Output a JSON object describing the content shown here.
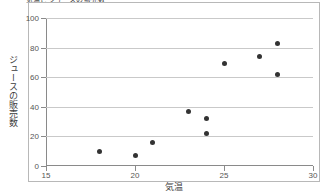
{
  "chart_data": {
    "type": "scatter",
    "title": "気温とジュースの販売数",
    "xlabel": "気温",
    "ylabel": "ジュースの販売数",
    "xlim": [
      15,
      30
    ],
    "ylim": [
      0,
      100
    ],
    "xticks": [
      "15",
      "20",
      "25",
      "30"
    ],
    "yticks": [
      "0",
      "20",
      "40",
      "60",
      "80",
      "100"
    ],
    "xtick_values": [
      15,
      20,
      25,
      30
    ],
    "ytick_values": [
      0,
      20,
      40,
      60,
      80,
      100
    ],
    "grid": "horizontal",
    "legend": "none",
    "marker_color": "#333333",
    "gridline_color": "#c9c9c9",
    "axis_color": "#8a8a8a",
    "points": [
      {
        "x": 18,
        "y": 10
      },
      {
        "x": 20,
        "y": 7
      },
      {
        "x": 21,
        "y": 16
      },
      {
        "x": 23,
        "y": 37
      },
      {
        "x": 24,
        "y": 22
      },
      {
        "x": 24,
        "y": 32
      },
      {
        "x": 25,
        "y": 69
      },
      {
        "x": 27,
        "y": 74
      },
      {
        "x": 28,
        "y": 62
      },
      {
        "x": 28,
        "y": 83
      }
    ]
  }
}
